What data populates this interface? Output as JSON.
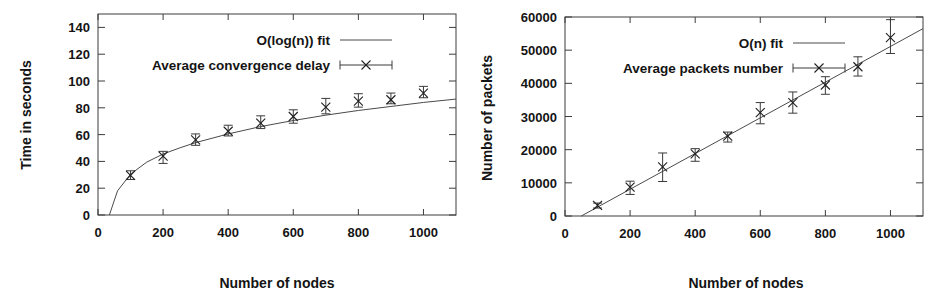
{
  "figure": {
    "panel_count": 2,
    "background": "#ffffff",
    "ink_color": "#1a1a1a"
  },
  "chart_data": [
    {
      "type": "scatter",
      "id": "convergence-delay",
      "title": "",
      "xlabel": "Number of nodes",
      "ylabel": "Time in seconds",
      "xlim": [
        0,
        1100
      ],
      "ylim": [
        0,
        150
      ],
      "xticks": [
        0,
        200,
        400,
        600,
        800,
        1000
      ],
      "xtick_labels": [
        "0",
        "200",
        "400",
        "600",
        "800",
        "1000"
      ],
      "yticks": [
        0,
        20,
        40,
        60,
        80,
        100,
        120,
        140
      ],
      "ytick_labels": [
        "0",
        "20",
        "40",
        "60",
        "80",
        "100",
        "120",
        "140"
      ],
      "grid": false,
      "legend_position": "top-center",
      "legend": [
        {
          "label": "O(log(n)) fit",
          "marker": "line"
        },
        {
          "label": "Average convergence delay",
          "marker": "x-errorbar"
        }
      ],
      "series": [
        {
          "name": "Average convergence delay",
          "marker": "x",
          "x": [
            100,
            200,
            300,
            400,
            500,
            600,
            700,
            800,
            900,
            1000
          ],
          "values": [
            29.5,
            44.0,
            56.0,
            62.5,
            68.5,
            73.5,
            80.5,
            85.0,
            86.0,
            91.0
          ],
          "yerr_low": [
            3.0,
            5.5,
            4.0,
            3.5,
            4.0,
            5.0,
            5.0,
            4.5,
            3.0,
            3.5
          ],
          "yerr_high": [
            3.5,
            3.5,
            4.5,
            4.5,
            5.5,
            5.0,
            6.5,
            5.5,
            5.0,
            5.0
          ]
        },
        {
          "name": "O(log(n)) fit",
          "marker": "line",
          "fit": "logarithmic",
          "x": [
            35,
            60,
            100,
            150,
            200,
            250,
            300,
            400,
            500,
            600,
            700,
            800,
            900,
            1000,
            1100
          ],
          "values": [
            0,
            18.0,
            30.5,
            39.5,
            45.5,
            50.0,
            54.0,
            60.5,
            66.0,
            70.5,
            74.5,
            78.0,
            81.0,
            84.0,
            86.5
          ]
        }
      ]
    },
    {
      "type": "scatter",
      "id": "packets-number",
      "title": "",
      "xlabel": "Number of nodes",
      "ylabel": "Number of packets",
      "xlim": [
        0,
        1100
      ],
      "ylim": [
        0,
        60000
      ],
      "xticks": [
        0,
        200,
        400,
        600,
        800,
        1000
      ],
      "xtick_labels": [
        "0",
        "200",
        "400",
        "600",
        "800",
        "1000"
      ],
      "yticks": [
        0,
        10000,
        20000,
        30000,
        40000,
        50000,
        60000
      ],
      "ytick_labels": [
        "0",
        "10000",
        "20000",
        "30000",
        "40000",
        "50000",
        "60000"
      ],
      "grid": false,
      "legend_position": "top-center",
      "legend": [
        {
          "label": "O(n) fit",
          "marker": "line"
        },
        {
          "label": "Average packets number",
          "marker": "x-errorbar"
        }
      ],
      "series": [
        {
          "name": "Average packets number",
          "marker": "x",
          "x": [
            100,
            200,
            300,
            400,
            500,
            600,
            700,
            800,
            900,
            1000
          ],
          "values": [
            3200,
            8700,
            14800,
            18700,
            24100,
            31200,
            34200,
            39500,
            45000,
            53800
          ],
          "yerr_low": [
            800,
            2200,
            4400,
            2200,
            1800,
            3400,
            3200,
            2800,
            2800,
            4800
          ],
          "yerr_high": [
            700,
            1800,
            4200,
            1600,
            1200,
            3000,
            3200,
            2500,
            3000,
            5400
          ]
        },
        {
          "name": "O(n) fit",
          "marker": "line",
          "fit": "linear",
          "x": [
            50,
            1100
          ],
          "values": [
            0,
            56500
          ]
        }
      ]
    }
  ]
}
